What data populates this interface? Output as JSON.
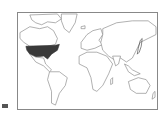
{
  "map": {
    "projection": "world",
    "highlighted_regions": [
      {
        "name": "United States",
        "style": "filled",
        "color": "#3a3a3a"
      },
      {
        "name": "Japan",
        "style": "outlined-bold",
        "color": "#3a3a3a"
      }
    ],
    "land_color": "#ffffff",
    "outline_color": "#7a7a7a",
    "frame_color": "#888888"
  },
  "marker": {
    "color": "#555555"
  }
}
